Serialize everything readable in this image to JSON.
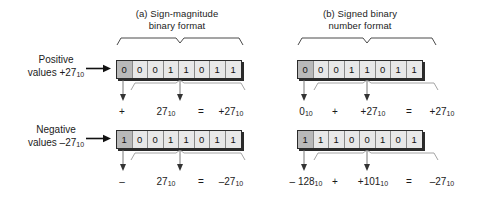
{
  "diagram": {
    "panels": [
      {
        "id": "a",
        "heading_line1": "(a) Sign-magnitude",
        "heading_line2": "binary format",
        "rows": [
          {
            "kind": "positive",
            "bits": [
              "0",
              "0",
              "0",
              "1",
              "1",
              "0",
              "1",
              "1"
            ],
            "sign_bit_index": 0,
            "equation": {
              "sign_term": "+",
              "magnitude_term": "27",
              "magnitude_sub": "10",
              "equals": "=",
              "result_term": "+27",
              "result_sub": "10"
            }
          },
          {
            "kind": "negative",
            "bits": [
              "1",
              "0",
              "0",
              "1",
              "1",
              "0",
              "1",
              "1"
            ],
            "sign_bit_index": 0,
            "equation": {
              "sign_term": "–",
              "magnitude_term": "27",
              "magnitude_sub": "10",
              "equals": "=",
              "result_term": "–27",
              "result_sub": "10"
            }
          }
        ]
      },
      {
        "id": "b",
        "heading_line1": "(b) Signed binary",
        "heading_line2": "number format",
        "rows": [
          {
            "kind": "positive",
            "bits": [
              "0",
              "0",
              "0",
              "1",
              "1",
              "0",
              "1",
              "1"
            ],
            "sign_bit_index": 0,
            "equation": {
              "sign_term": "0",
              "sign_sub": "10",
              "plus": "+",
              "magnitude_term": "+27",
              "magnitude_sub": "10",
              "equals": "=",
              "result_term": "+27",
              "result_sub": "10"
            }
          },
          {
            "kind": "negative",
            "bits": [
              "1",
              "1",
              "1",
              "0",
              "0",
              "1",
              "0",
              "1"
            ],
            "sign_bit_index": 0,
            "equation": {
              "sign_term": "– 128",
              "sign_sub": "10",
              "plus": "+",
              "magnitude_term": "+101",
              "magnitude_sub": "10",
              "equals": "=",
              "result_term": "–27",
              "result_sub": "10"
            }
          }
        ]
      }
    ],
    "row_labels": [
      {
        "id": "positive",
        "line1": "Positive",
        "line2": "values +27",
        "line2_sub": "10"
      },
      {
        "id": "negative",
        "line1": "Negative",
        "line2": "values –27",
        "line2_sub": "10"
      }
    ],
    "colors": {
      "ink": "#1b1b1b",
      "cell_fill": "#e8e8e8",
      "sign_cell_fill": "#b9b9b9",
      "cell_border": "#2a2a2a",
      "divider": "#8a8a8a",
      "shadow": "#2b2b2b",
      "background": "#ffffff"
    }
  }
}
